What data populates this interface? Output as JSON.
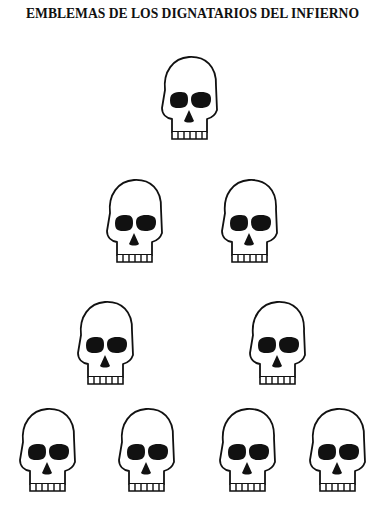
{
  "title": "EMBLEMAS DE LOS DIGNATARIOS DEL INFIERNO",
  "emblem_icon": "skull-icon",
  "colors": {
    "ink": "#111111",
    "paper": "#ffffff"
  },
  "rows": [
    {
      "count": 1,
      "skulls": [
        {
          "x": 155,
          "y": 52
        }
      ]
    },
    {
      "count": 2,
      "skulls": [
        {
          "x": 100,
          "y": 175
        },
        {
          "x": 215,
          "y": 175
        }
      ]
    },
    {
      "count": 2,
      "skulls": [
        {
          "x": 71,
          "y": 297
        },
        {
          "x": 243,
          "y": 297
        }
      ]
    },
    {
      "count": 4,
      "skulls": [
        {
          "x": 13,
          "y": 404
        },
        {
          "x": 112,
          "y": 404
        },
        {
          "x": 213,
          "y": 404
        },
        {
          "x": 303,
          "y": 404
        }
      ]
    }
  ]
}
